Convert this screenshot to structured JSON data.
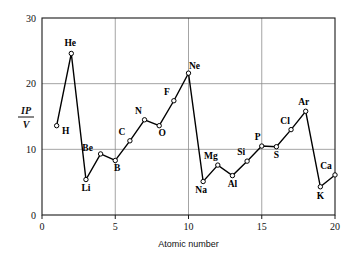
{
  "chart_data": {
    "type": "line",
    "title": "",
    "xlabel": "Atomic number",
    "ylabel": "IP/V",
    "ylabel_numerator": "IP",
    "ylabel_denominator": "V",
    "xlim": [
      0,
      20
    ],
    "ylim": [
      0,
      30
    ],
    "xticks": [
      0,
      5,
      10,
      15,
      20
    ],
    "yticks": [
      0,
      10,
      20,
      30
    ],
    "xtick_labels": [
      "0",
      "5",
      "10",
      "15",
      "20"
    ],
    "ytick_labels": [
      "0",
      "10",
      "20",
      "30"
    ],
    "grid": "gridlines at y=10, y=20 and x=5, x=10, x=15",
    "legend": "none",
    "marker": "open-circle",
    "series": [
      {
        "name": "First ionization potential",
        "x": [
          1,
          2,
          3,
          4,
          5,
          6,
          7,
          8,
          9,
          10,
          11,
          12,
          13,
          14,
          15,
          16,
          17,
          18,
          19,
          20
        ],
        "values": [
          13.6,
          24.6,
          5.4,
          9.3,
          8.3,
          11.3,
          14.5,
          13.6,
          17.4,
          21.6,
          5.1,
          7.6,
          6.0,
          8.2,
          10.5,
          10.4,
          13.0,
          15.8,
          4.3,
          6.1
        ]
      }
    ],
    "point_labels": [
      {
        "symbol": "H",
        "x": 1,
        "y": 13.6,
        "dx": 9,
        "dy": 8
      },
      {
        "symbol": "He",
        "x": 2,
        "y": 24.6,
        "dx": -1,
        "dy": -7
      },
      {
        "symbol": "Li",
        "x": 3,
        "y": 5.4,
        "dx": 0,
        "dy": 11
      },
      {
        "symbol": "Be",
        "x": 4,
        "y": 9.3,
        "dx": -13,
        "dy": -3
      },
      {
        "symbol": "B",
        "x": 5,
        "y": 8.3,
        "dx": 2,
        "dy": 10
      },
      {
        "symbol": "C",
        "x": 6,
        "y": 11.3,
        "dx": -8,
        "dy": -6
      },
      {
        "symbol": "N",
        "x": 7,
        "y": 14.5,
        "dx": -6,
        "dy": -6
      },
      {
        "symbol": "O",
        "x": 8,
        "y": 13.6,
        "dx": 3,
        "dy": 10
      },
      {
        "symbol": "F",
        "x": 9,
        "y": 17.4,
        "dx": -7,
        "dy": -6
      },
      {
        "symbol": "Ne",
        "x": 10,
        "y": 21.6,
        "dx": 6,
        "dy": -4
      },
      {
        "symbol": "Na",
        "x": 11,
        "y": 5.1,
        "dx": -2,
        "dy": 11
      },
      {
        "symbol": "Mg",
        "x": 12,
        "y": 7.6,
        "dx": -7,
        "dy": -6
      },
      {
        "symbol": "Al",
        "x": 13,
        "y": 6.0,
        "dx": 0,
        "dy": 11
      },
      {
        "symbol": "Si",
        "x": 14,
        "y": 8.2,
        "dx": -6,
        "dy": -6
      },
      {
        "symbol": "P",
        "x": 15,
        "y": 10.5,
        "dx": -4,
        "dy": -6
      },
      {
        "symbol": "S",
        "x": 16,
        "y": 10.4,
        "dx": 0,
        "dy": 11
      },
      {
        "symbol": "Cl",
        "x": 17,
        "y": 13.0,
        "dx": -6,
        "dy": -6
      },
      {
        "symbol": "Ar",
        "x": 18,
        "y": 15.8,
        "dx": -2,
        "dy": -6
      },
      {
        "symbol": "K",
        "x": 19,
        "y": 4.3,
        "dx": 0,
        "dy": 12
      },
      {
        "symbol": "Ca",
        "x": 20,
        "y": 6.1,
        "dx": -9,
        "dy": -6
      }
    ],
    "colors": {
      "line": "#000000",
      "marker_fill": "#ffffff",
      "marker_stroke": "#000000",
      "grid": "#8d8d8d",
      "frame": "#1a1a1a",
      "background": "#ffffff",
      "text": "#111111"
    }
  }
}
